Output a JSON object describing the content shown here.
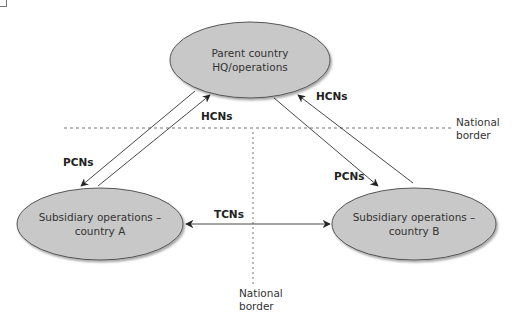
{
  "diagram": {
    "type": "flow",
    "nodes": {
      "parent": {
        "line1": "Parent country",
        "line2": "HQ/operations"
      },
      "sub_a": {
        "line1": "Subsidiary operations –",
        "line2": "country A"
      },
      "sub_b": {
        "line1": "Subsidiary operations –",
        "line2": "country B"
      }
    },
    "edges": {
      "parent_to_a": "PCNs",
      "a_to_parent": "HCNs",
      "parent_to_b": "PCNs",
      "b_to_parent": "HCNs",
      "a_b": "TCNs"
    },
    "borders": {
      "horizontal": {
        "line1": "National",
        "line2": "border"
      },
      "vertical": {
        "line1": "National",
        "line2": "border"
      }
    },
    "colors": {
      "node_fill": "#c8c8c8",
      "node_stroke": "#555555",
      "arrow": "#333333",
      "border_line": "#777777"
    }
  }
}
